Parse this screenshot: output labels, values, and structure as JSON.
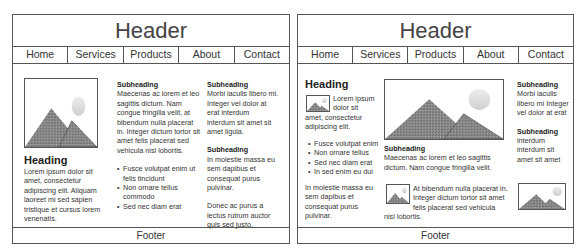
{
  "left": {
    "header": "Header",
    "nav": [
      "Home",
      "Services",
      "Products",
      "About",
      "Contact"
    ],
    "footer": "Footer",
    "col1": {
      "image": "mountain-image",
      "heading": "Heading",
      "body": "Lorem ipsum dolor sit amet, consectetur adipiscing elit. Aliquam laoreet mi sed sapien tristique et cursus lorem venenatis."
    },
    "col2": {
      "subheading": "Subheading",
      "body": "Maecenas ac lorem et leo sagittis dictum. Nam congue fringilla velit, at bibendum nulla placerat in. Integer dictum tortor sit amet felis placerat sed vehicula nisl lobortis.",
      "bullets": [
        "Fusce volutpat enim ut felis tincidunt",
        "Non ornare tellus commodo",
        "Sed nec diam erat"
      ]
    },
    "col3": {
      "subheading1": "Subheading",
      "body1": "Morbi iaculis libero mi. Integer vel dolor at erat interdum interdum sit amet sit amet ligula.",
      "subheading2": "Subheading",
      "body2": "In molestie massa eu sem dapibus et consequat purus pulvinar.",
      "body3": "Donec ac purus a lectus rutrum auctor quis sed justo."
    }
  },
  "right": {
    "header": "Header",
    "nav": [
      "Home",
      "Services",
      "Products",
      "About",
      "Contact"
    ],
    "footer": "Footer",
    "col1": {
      "heading": "Heading",
      "intro": "Lorem ipsum dolor sit amet, consectetur adipiscing elit.",
      "bullets": [
        "Fusce volutpat enim",
        "Non ornare tellus",
        "Sed nec diam erat",
        "In sed enim eu dui"
      ],
      "body": "In molestie massa eu sem dapibus et consequat purus pulvinar."
    },
    "col2": {
      "subheading": "Subheading",
      "body": "Maecenas ac lorem et leo sagittis dictum. Nam congue fringilla velit.",
      "body2": "At bibendum nulla placerat in. Integer dictum tortor sit amet felis placerat sed vehicula nisl lobortis."
    },
    "col3": {
      "subheading1": "Subheading",
      "body1": "Morbi iaculis libero mi Integer vel dolor at erat",
      "subheading2": "Subheading",
      "body2": "interdum interdum sit amet sit amet"
    }
  }
}
